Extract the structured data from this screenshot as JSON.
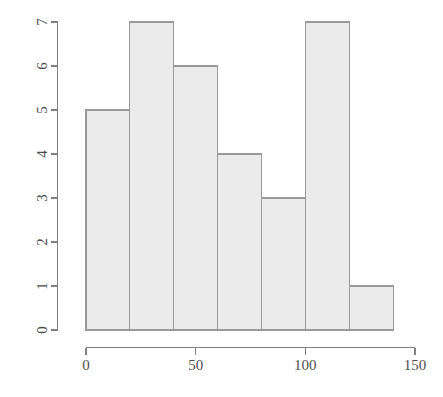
{
  "chart_data": {
    "type": "bar",
    "subtype": "histogram",
    "title": "",
    "subtitle": "",
    "xlabel": "",
    "ylabel": "",
    "bin_width": 20,
    "bin_edges": [
      0,
      20,
      40,
      60,
      80,
      100,
      120,
      140
    ],
    "categories": [
      "0-20",
      "20-40",
      "40-60",
      "60-80",
      "80-100",
      "100-120",
      "120-140"
    ],
    "bin_centers": [
      10,
      30,
      50,
      70,
      90,
      110,
      130
    ],
    "values": [
      5,
      7,
      6,
      4,
      3,
      7,
      1
    ],
    "xlim": [
      0,
      150
    ],
    "ylim": [
      0,
      7
    ],
    "xticks": [
      0,
      50,
      100,
      150
    ],
    "xtick_labels": [
      "0",
      "50",
      "100",
      "150"
    ],
    "yticks": [
      0,
      1,
      2,
      3,
      4,
      5,
      6,
      7
    ],
    "ytick_labels": [
      "0",
      "1",
      "2",
      "3",
      "4",
      "5",
      "6",
      "7"
    ],
    "grid": false,
    "legend": null,
    "annotations": [],
    "total_count": 33,
    "style": {
      "bar_fill": "#ebebeb",
      "bar_stroke": "#999999",
      "axis_color": "#808080",
      "label_color": "#4d4d4d",
      "background": "#ffffff",
      "ytick_label_rotation": -90
    }
  }
}
